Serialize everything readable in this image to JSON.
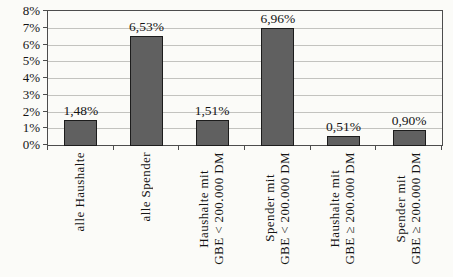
{
  "chart_data": {
    "type": "bar",
    "title": "",
    "xlabel": "",
    "ylabel": "",
    "categories": [
      "alle Haushalte",
      "alle Spender",
      "Haushalte mit\nGBE < 200.000 DM",
      "Spender mit\nGBE < 200.000 DM",
      "Haushalte mit\nGBE ≥ 200.000 DM",
      "Spender mit\nGBE ≥ 200.000 DM"
    ],
    "values": [
      1.48,
      6.53,
      1.51,
      6.96,
      0.51,
      0.9
    ],
    "value_labels": [
      "1,48%",
      "6,53%",
      "1,51%",
      "6,96%",
      "0,51%",
      "0,90%"
    ],
    "ylim": [
      0,
      8
    ],
    "y_tick_step": 1,
    "y_tick_labels": [
      "0%",
      "1%",
      "2%",
      "3%",
      "4%",
      "5%",
      "6%",
      "7%",
      "8%"
    ],
    "grid": true,
    "legend": "none",
    "bar_color": "#606060",
    "bar_border_color": "#1c1c1c",
    "gridline_color": "#c3c3bf",
    "axis_color": "#4d4d4d",
    "text_color": "#141414",
    "background_color": "#fbfbf8"
  }
}
